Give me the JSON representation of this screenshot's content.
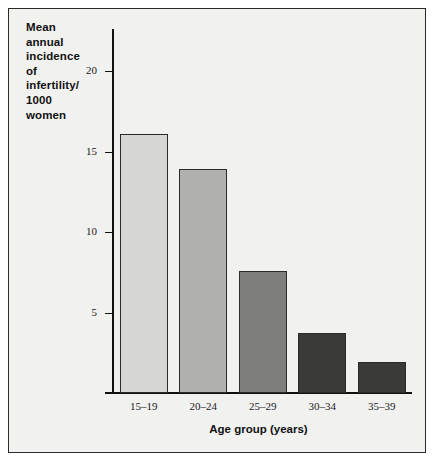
{
  "chart_data": {
    "type": "bar",
    "title": "",
    "xlabel": "Age group (years)",
    "ylabel": "Mean annual incidence of infertility/ 1000 women",
    "categories": [
      "15–19",
      "20–24",
      "25–29",
      "30–34",
      "35–39"
    ],
    "values": [
      16.1,
      13.9,
      7.6,
      3.7,
      1.9
    ],
    "ylim": [
      0,
      22
    ],
    "yticks": [
      5,
      10,
      15,
      20
    ],
    "ytick_labels": [
      "5",
      "10",
      "15",
      "20"
    ],
    "grid": false,
    "legend": null,
    "bar_colors": [
      "#d6d6d4",
      "#b0b0ae",
      "#7e7e7c",
      "#3a3a39",
      "#3a3a39"
    ],
    "bar_border_color": "#2b2b2b"
  },
  "y_axis": {
    "title_lines": [
      "Mean",
      "annual",
      "incidence",
      "of",
      "infertility/",
      "1000",
      "women"
    ],
    "tick_labels": [
      "20",
      "15",
      "10",
      "5"
    ]
  },
  "x_axis": {
    "title": "Age group (years)",
    "tick_labels": [
      "15–19",
      "20–24",
      "25–29",
      "30–34",
      "35–39"
    ]
  },
  "style": {
    "background": "#f1f1f0",
    "frame_color": "#2a2a2a",
    "axis_color": "#101010",
    "text_color": "#121212"
  }
}
